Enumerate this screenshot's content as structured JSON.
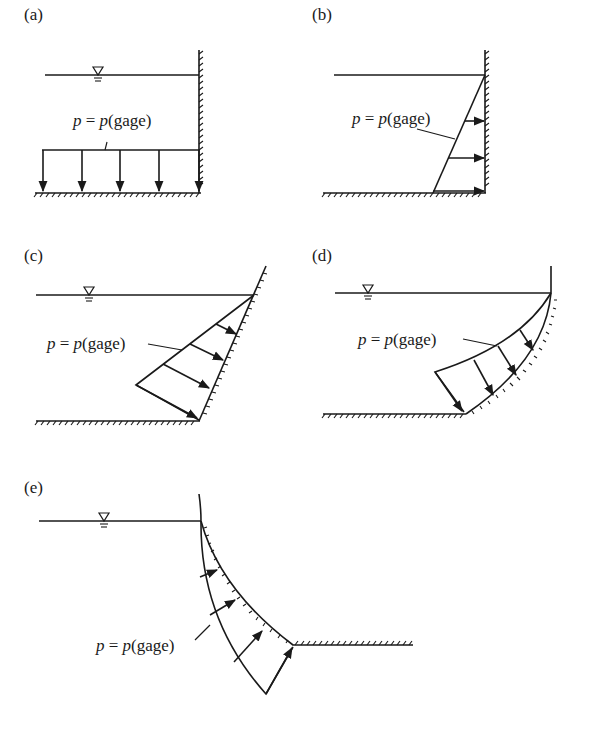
{
  "figure": {
    "panels": [
      {
        "id": "a",
        "label": "(a)",
        "equation": {
          "p": "p",
          "eq": " = ",
          "p2": "p",
          "rest": "(gage)"
        },
        "has_free_surface_symbol": true,
        "description": "horizontal bottom with vertical wall; uniform downward pressure"
      },
      {
        "id": "b",
        "label": "(b)",
        "equation": {
          "p": "p",
          "eq": " = ",
          "p2": "p",
          "rest": "(gage)"
        },
        "has_free_surface_symbol": false,
        "description": "vertical wall; triangular horizontal pressure distribution"
      },
      {
        "id": "c",
        "label": "(c)",
        "equation": {
          "p": "p",
          "eq": " = ",
          "p2": "p",
          "rest": "(gage)"
        },
        "has_free_surface_symbol": true,
        "description": "inclined wall; triangular pressure normal to wall"
      },
      {
        "id": "d",
        "label": "(d)",
        "equation": {
          "p": "p",
          "eq": " = ",
          "p2": "p",
          "rest": "(gage)"
        },
        "has_free_surface_symbol": true,
        "description": "concave curved wall; pressure normal to curved surface"
      },
      {
        "id": "e",
        "label": "(e)",
        "equation": {
          "p": "p",
          "eq": " = ",
          "p2": "p",
          "rest": "(gage)"
        },
        "has_free_surface_symbol": true,
        "description": "convex curved wall; pressure normal to curved surface"
      }
    ],
    "colors": {
      "ink": "#1a1a1a",
      "background": "#ffffff"
    }
  }
}
